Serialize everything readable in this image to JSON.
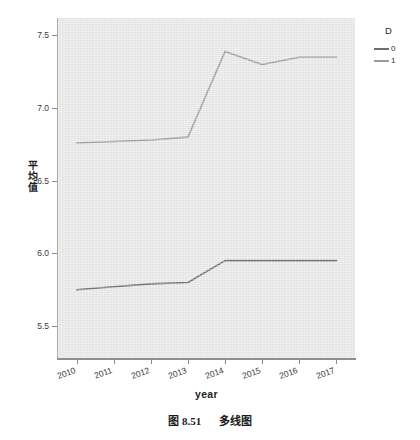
{
  "chart_data": {
    "type": "line",
    "title": "",
    "xlabel": "year",
    "ylabel": "平均值",
    "categories": [
      "2010",
      "2011",
      "2012",
      "2013",
      "2014",
      "2015",
      "2016",
      "2017"
    ],
    "ylim": [
      5.28,
      7.62
    ],
    "yticks": [
      5.5,
      6.0,
      6.5,
      7.0,
      7.5
    ],
    "ytick_labels": [
      "5.5",
      "6.0",
      "6.5",
      "7.0",
      "7.5"
    ],
    "grid": false,
    "legend_position": "right",
    "legend_title": "D",
    "series": [
      {
        "name": "0",
        "color": "#6d6d6d",
        "values": [
          5.75,
          5.77,
          5.79,
          5.8,
          5.95,
          5.95,
          5.95,
          5.95
        ]
      },
      {
        "name": "1",
        "color": "#9c9c9c",
        "values": [
          6.76,
          6.77,
          6.78,
          6.8,
          7.39,
          7.3,
          7.35,
          7.35
        ]
      }
    ]
  },
  "legend": {
    "title": "D",
    "items": [
      {
        "label": "0",
        "color": "#6d6d6d"
      },
      {
        "label": "1",
        "color": "#9c9c9c"
      }
    ]
  },
  "axes": {
    "y_title": "平均值",
    "y_title_chars": [
      "平",
      "均",
      "值"
    ],
    "x_title": "year"
  },
  "caption": {
    "number": "图 8.51",
    "text": "多线图"
  },
  "colors": {
    "panel": "#e9e9e9",
    "axis": "#8e8e8e",
    "series_0": "#6d6d6d",
    "series_1": "#9c9c9c",
    "text": "#1e1e1e"
  }
}
